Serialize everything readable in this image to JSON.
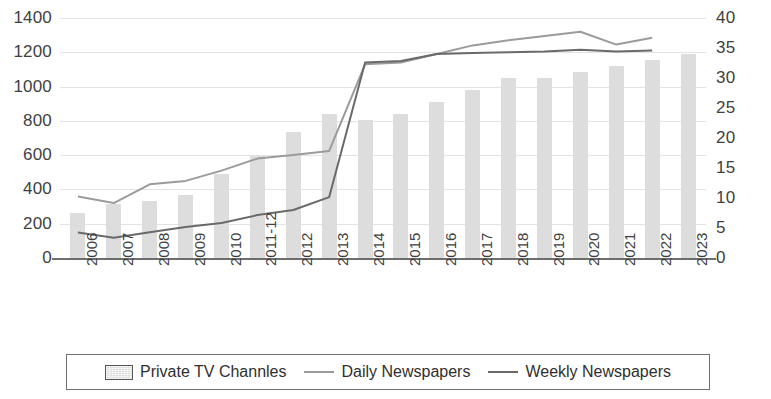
{
  "chart_data": {
    "type": "bar",
    "title": "",
    "subtitle": "",
    "xlabel": "",
    "ylabel": "",
    "grid": true,
    "legend_position": "bottom",
    "categories": [
      "2006",
      "2007",
      "2008",
      "2009",
      "2010",
      "2011-12",
      "2012",
      "2013",
      "2014",
      "2015",
      "2016",
      "2017",
      "2018",
      "2019",
      "2020",
      "2021",
      "2022",
      "2023"
    ],
    "left_axis": {
      "ylim": [
        0,
        1400
      ],
      "ticks": [
        0,
        200,
        400,
        600,
        800,
        1000,
        1200,
        1400
      ],
      "tick_labels": [
        "0",
        "200",
        "400",
        "600",
        "800",
        "1000",
        "1200",
        "1400"
      ]
    },
    "right_axis": {
      "ylim": [
        0,
        40
      ],
      "ticks": [
        0,
        5,
        10,
        15,
        20,
        25,
        30,
        35,
        40
      ],
      "tick_labels": [
        "0",
        "5",
        "10",
        "15",
        "20",
        "25",
        "30",
        "35",
        "40"
      ]
    },
    "series": [
      {
        "name": "Private TV Channles",
        "type": "bar",
        "axis": "right",
        "color": "#dddddd",
        "values": [
          7.5,
          9.0,
          9.5,
          10.5,
          14.0,
          17.0,
          21.0,
          24.0,
          23.0,
          24.0,
          26.0,
          28.0,
          30.0,
          30.0,
          31.0,
          32.0,
          33.0,
          34.0
        ]
      },
      {
        "name": "Daily Newspapers",
        "type": "line",
        "axis": "left",
        "color": "#9b9b9b",
        "values": [
          358,
          320,
          430,
          450,
          510,
          580,
          600,
          625,
          1130,
          1140,
          1190,
          1240,
          1270,
          1295,
          1320,
          1245,
          1285,
          null
        ]
      },
      {
        "name": "Weekly Newspapers",
        "type": "line",
        "axis": "left",
        "color": "#6a6a6a",
        "values": [
          148,
          118,
          150,
          180,
          205,
          250,
          280,
          355,
          1140,
          1150,
          1190,
          1195,
          1200,
          1205,
          1215,
          1205,
          1210,
          null
        ]
      }
    ]
  },
  "legend": {
    "items": [
      {
        "label": "Private TV Channles",
        "marker": "bar-swatch"
      },
      {
        "label": "Daily Newspapers",
        "marker": "line-swatch-light"
      },
      {
        "label": "Weekly Newspapers",
        "marker": "line-swatch-dark"
      }
    ]
  }
}
